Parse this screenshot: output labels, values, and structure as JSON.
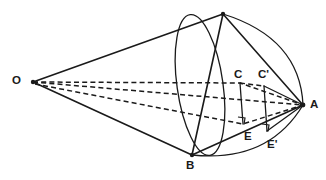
{
  "figure": {
    "stroke_color": "#1a1a1a",
    "background_color": "#ffffff",
    "width": 326,
    "height": 180,
    "labels": [
      {
        "id": "O",
        "text": "O",
        "x": 12,
        "y": 75
      },
      {
        "id": "C",
        "text": "C",
        "x": 234,
        "y": 69
      },
      {
        "id": "Cp",
        "text": "C'",
        "x": 258,
        "y": 69
      },
      {
        "id": "A",
        "text": "A",
        "x": 310,
        "y": 99
      },
      {
        "id": "E",
        "text": "E",
        "x": 244,
        "y": 131
      },
      {
        "id": "Ep",
        "text": "E'",
        "x": 267,
        "y": 139
      },
      {
        "id": "B",
        "text": "B",
        "x": 186,
        "y": 160
      }
    ],
    "points": {
      "O": {
        "x": 33,
        "y": 82
      },
      "S": {
        "x": 223,
        "y": 14
      },
      "A": {
        "x": 303,
        "y": 105
      },
      "B": {
        "x": 192,
        "y": 155
      },
      "C": {
        "x": 240,
        "y": 83
      },
      "Cp": {
        "x": 264,
        "y": 86
      },
      "E": {
        "x": 243,
        "y": 124
      },
      "Ep": {
        "x": 267,
        "y": 131
      }
    },
    "ellipse": {
      "cx": 200,
      "cy": 85,
      "rx": 23,
      "ry": 71,
      "rotation": -8
    }
  }
}
